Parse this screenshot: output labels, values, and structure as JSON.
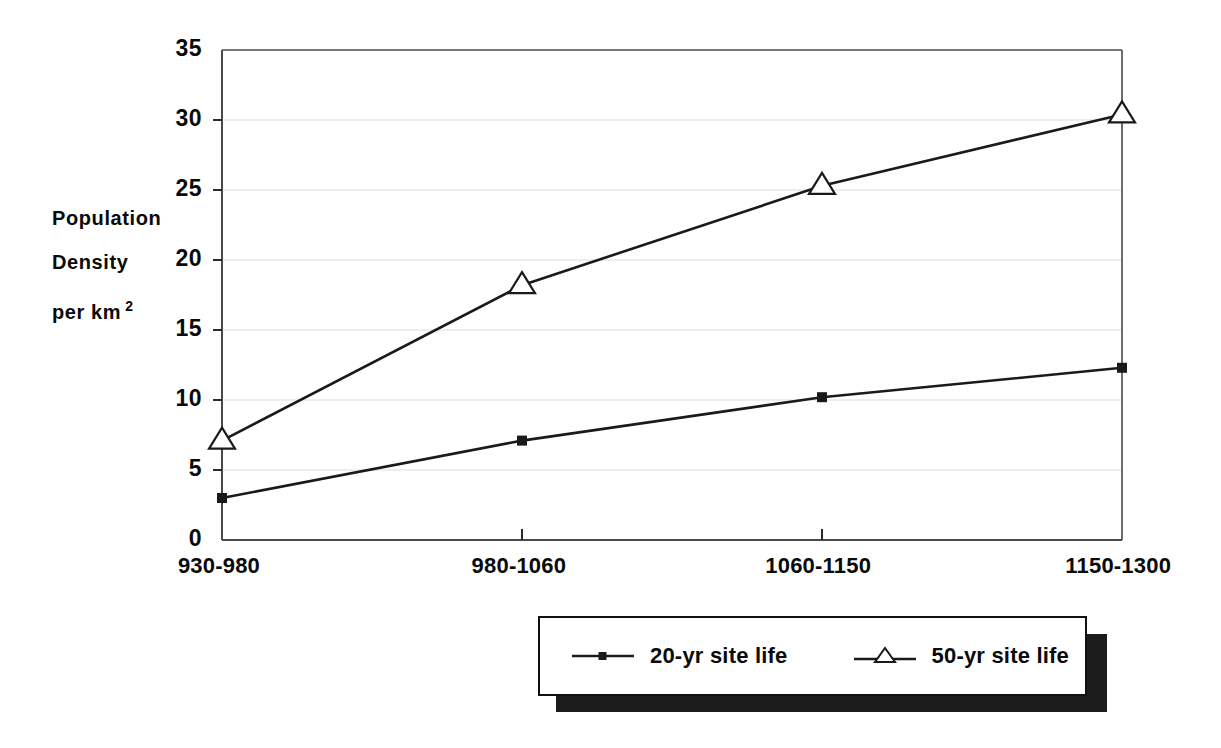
{
  "chart_data": {
    "type": "line",
    "title": "",
    "xlabel": "",
    "ylabel": "Population Density per km 2",
    "categories": [
      "930-980",
      "980-1060",
      "1060-1150",
      "1150-1300"
    ],
    "series": [
      {
        "name": "20-yr site life",
        "marker": "filled-square",
        "values": [
          3.0,
          7.1,
          10.2,
          12.3
        ]
      },
      {
        "name": "50-yr site life",
        "marker": "open-triangle",
        "values": [
          7.1,
          18.2,
          25.3,
          30.4
        ]
      }
    ],
    "ylim": [
      0,
      35
    ],
    "yticks": [
      0,
      5,
      10,
      15,
      20,
      25,
      30,
      35
    ],
    "ytick_labels": [
      "0",
      "5",
      "10",
      "15",
      "20",
      "25",
      "30",
      "35"
    ],
    "grid": "horizontal-light",
    "legend_position": "bottom-center",
    "line_color": "#1a1a1a",
    "grid_color": "#dcdcdc",
    "axis_color": "#4a4a4a"
  },
  "y_axis_title": {
    "line1": "Population",
    "line2": "Density",
    "line3": "per km",
    "exponent": "2"
  },
  "legend": {
    "entries": [
      {
        "label": "20-yr site life"
      },
      {
        "label": "50-yr site life"
      }
    ]
  }
}
